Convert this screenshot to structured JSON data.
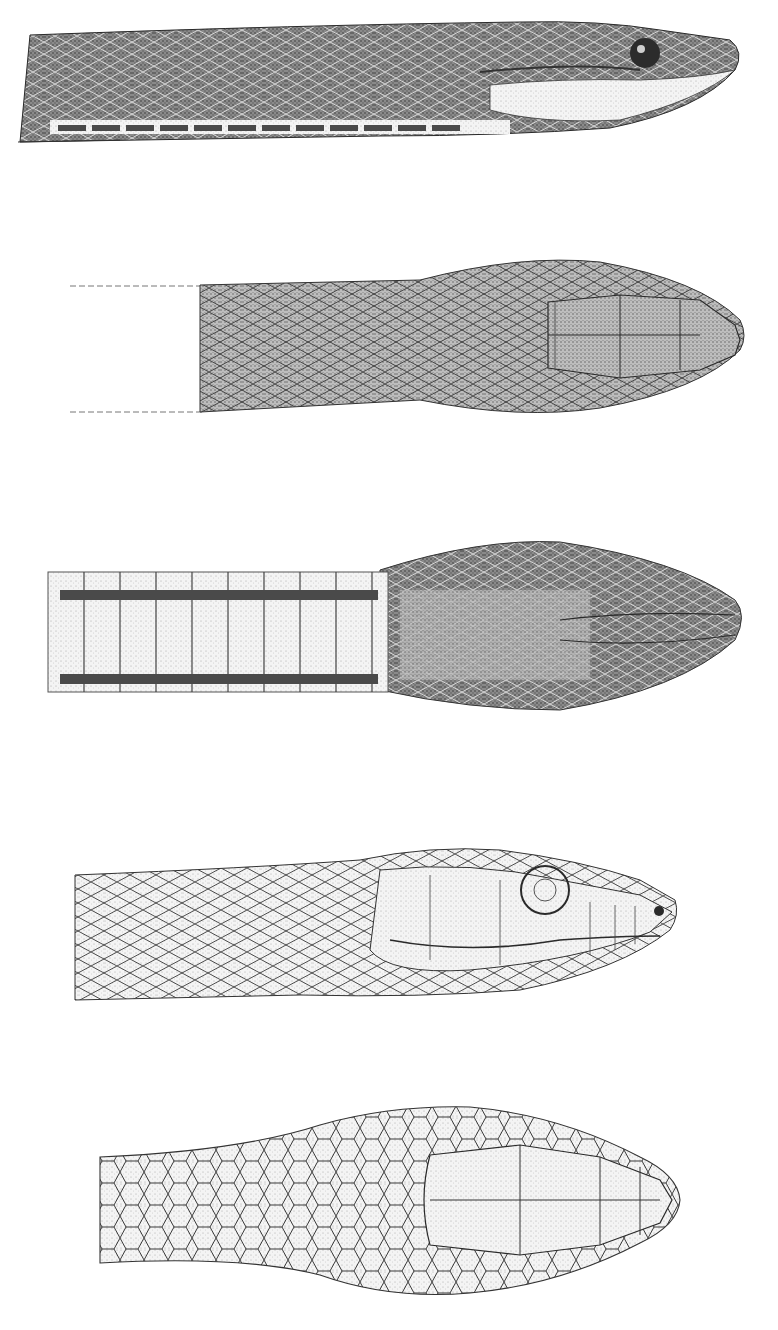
{
  "plate": {
    "background": "#ffffff",
    "ink": "#2a2a2a",
    "stipple_light": "#cfcfcf",
    "stipple_dark": "#6a6a6a",
    "figures": [
      {
        "id": "fig-1",
        "view": "lateral",
        "style": "shaded",
        "bbox": [
          18,
          18,
          740,
          145
        ]
      },
      {
        "id": "fig-2",
        "view": "dorsal",
        "style": "shaded",
        "bbox": [
          68,
          255,
          745,
          420
        ]
      },
      {
        "id": "fig-3",
        "view": "ventral",
        "style": "shaded",
        "bbox": [
          30,
          540,
          745,
          715
        ]
      },
      {
        "id": "fig-4",
        "view": "lateral",
        "style": "outline",
        "bbox": [
          70,
          848,
          680,
          1000
        ]
      },
      {
        "id": "fig-5",
        "view": "dorsal",
        "style": "outline",
        "bbox": [
          98,
          1105,
          680,
          1305
        ]
      }
    ],
    "bleedthrough_text": [
      "",
      ""
    ]
  }
}
